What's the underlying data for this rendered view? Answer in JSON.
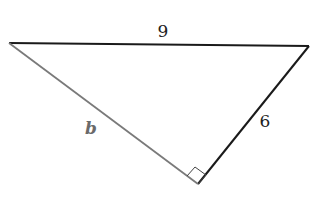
{
  "diagram": {
    "type": "right-triangle",
    "vertices": {
      "left": {
        "x": 9,
        "y": 43
      },
      "right": {
        "x": 309,
        "y": 46
      },
      "bottom": {
        "x": 198,
        "y": 184
      }
    },
    "sides": [
      {
        "name": "top",
        "label": "9",
        "color": "#1a1a1a"
      },
      {
        "name": "right",
        "label": "6",
        "color": "#1a1a1a"
      },
      {
        "name": "left",
        "label": "b",
        "color": "#7a7a7a"
      }
    ],
    "right_angle_at": "bottom"
  }
}
